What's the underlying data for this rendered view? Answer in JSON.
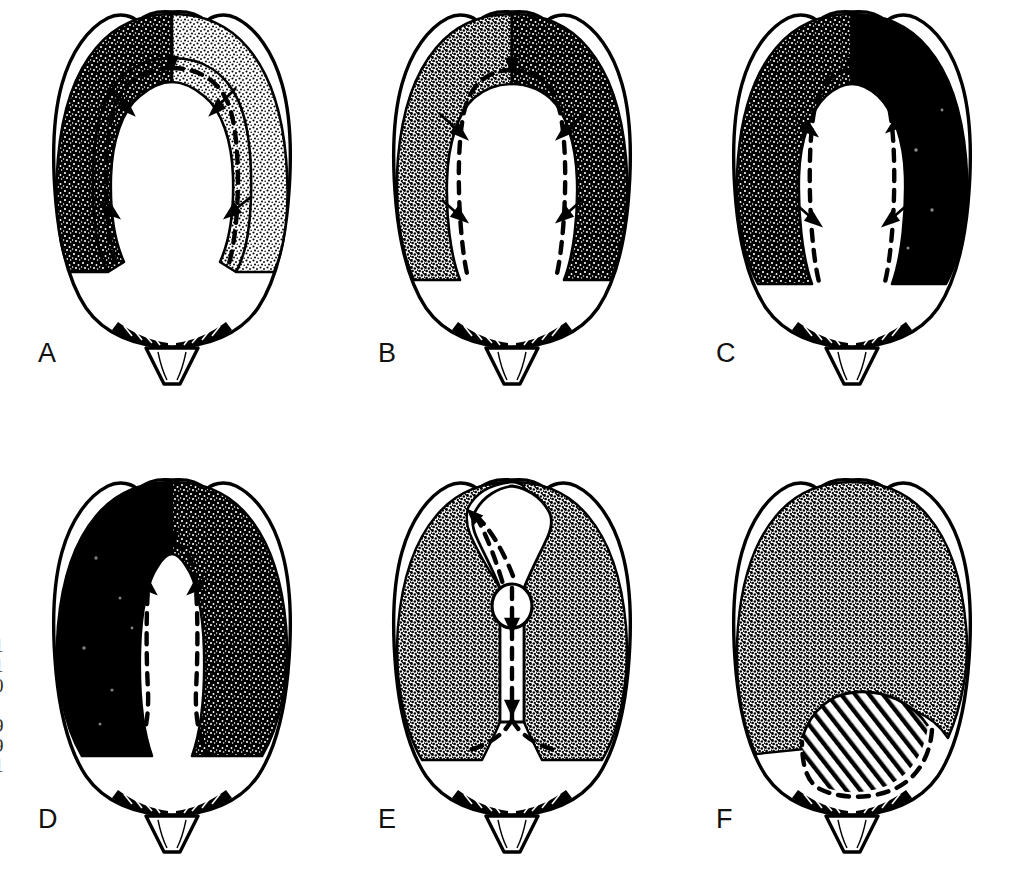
{
  "figure": {
    "view": "dorsal",
    "background_color": "#ffffff",
    "ink_color": "#000000",
    "layout": {
      "rows": 2,
      "columns": 3
    },
    "margin_text": "1\n1\n0\n-\n9\n9\n1"
  },
  "panels": [
    {
      "label": "A",
      "name": "head-capsule-a",
      "pigment_description": "Narrow dark band along anterior and lateral margins; left side dense black stipple, right side lighter stipple; large pale central area",
      "pigment_coverage_percent": 28,
      "stipple_density_left": "dense",
      "stipple_density_right": "light",
      "arrow_count": 5,
      "has_dashed_sutures": true,
      "has_hatching": false,
      "has_median_oval": false
    },
    {
      "label": "B",
      "name": "head-capsule-b",
      "pigment_description": "Broader dark band extending down both lateral margins; left stipple medium, right stipple dense black; pale central tongue narrower than A",
      "pigment_coverage_percent": 40,
      "stipple_density_left": "medium",
      "stipple_density_right": "dense",
      "arrow_count": 5,
      "has_dashed_sutures": true,
      "has_hatching": false,
      "has_median_oval": false
    },
    {
      "label": "C",
      "name": "head-capsule-c",
      "pigment_description": "Dark pigment covers most of the upper head capsule leaving only a narrow pale median strip; right side solid black",
      "pigment_coverage_percent": 55,
      "stipple_density_left": "dense",
      "stipple_density_right": "solid",
      "arrow_count": 5,
      "has_dashed_sutures": true,
      "has_hatching": false,
      "has_median_oval": false
    },
    {
      "label": "D",
      "name": "head-capsule-d",
      "pigment_description": "Heavy dark pigment forming a broad horseshoe; pale median strip very narrow and extending to posterior pale region",
      "pigment_coverage_percent": 58,
      "stipple_density_left": "solid",
      "stipple_density_right": "dense",
      "arrow_count": 3,
      "has_dashed_sutures": true,
      "has_hatching": false,
      "has_median_oval": false
    },
    {
      "label": "E",
      "name": "head-capsule-e",
      "pigment_description": "Uniform medium stipple over the whole upper head capsule; narrow pale median frontal strip containing an oval structure; dashed ecdysial line forks posteriorly",
      "pigment_coverage_percent": 62,
      "stipple_density_left": "medium",
      "stipple_density_right": "medium",
      "arrow_count": 3,
      "has_dashed_sutures": true,
      "has_hatching": false,
      "has_median_oval": true
    },
    {
      "label": "F",
      "name": "head-capsule-f",
      "pigment_description": "Even stipple covering entire upper head capsule without pale median strip; a diagonally hatched band lies below, bounded by a dashed arc",
      "pigment_coverage_percent": 70,
      "stipple_density_left": "medium",
      "stipple_density_right": "medium",
      "arrow_count": 0,
      "has_dashed_sutures": true,
      "has_hatching": true,
      "has_median_oval": false
    }
  ],
  "shared_features": {
    "outline": "oval head capsule with small median notch at anterior margin",
    "labrum": "triangular labrum at posterior midline",
    "mandible_fringe": "dark serrated fringe flanking the labrum on both sides",
    "suture_style": "dashed"
  }
}
